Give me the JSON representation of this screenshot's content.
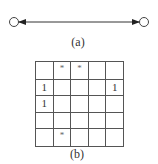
{
  "figure_a": {
    "caption": "(a)",
    "nodes": [
      "left-node",
      "right-node"
    ],
    "edge": "bidirectional-arrow"
  },
  "figure_b": {
    "caption": "(b)",
    "rows": 5,
    "cols": 5,
    "cells": [
      [
        "",
        "*",
        "*",
        "",
        ""
      ],
      [
        "1",
        "",
        "",
        "",
        "1"
      ],
      [
        "1",
        "",
        "",
        "",
        ""
      ],
      [
        "",
        "",
        "",
        "",
        ""
      ],
      [
        "",
        "*",
        "",
        "",
        ""
      ]
    ]
  }
}
